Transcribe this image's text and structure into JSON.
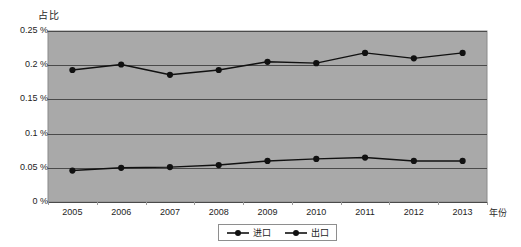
{
  "chart_data": {
    "type": "line",
    "title": "",
    "ylabel": "占比",
    "xlabel": "年份",
    "categories": [
      "2005",
      "2006",
      "2007",
      "2008",
      "2009",
      "2010",
      "2011",
      "2012",
      "2013"
    ],
    "ylim": [
      0,
      0.25
    ],
    "ytick_labels": [
      "0.25 %",
      "0.2 %",
      "0.15 %",
      "0.1 %",
      "0.05 %",
      "0  %"
    ],
    "ytick_values": [
      0.25,
      0.2,
      0.15,
      0.1,
      0.05,
      0
    ],
    "grid": true,
    "legend_position": "bottom",
    "plot_background": "#a9a9a9",
    "series": [
      {
        "name": "进口",
        "color": "#111111",
        "marker": "circle",
        "values": [
          0.193,
          0.201,
          0.186,
          0.193,
          0.205,
          0.203,
          0.218,
          0.21,
          0.218
        ]
      },
      {
        "name": "出口",
        "color": "#111111",
        "marker": "circle",
        "values": [
          0.046,
          0.05,
          0.051,
          0.054,
          0.06,
          0.063,
          0.065,
          0.06,
          0.06
        ]
      }
    ]
  },
  "legend": {
    "entries": [
      {
        "label": "进口"
      },
      {
        "label": "出口"
      }
    ]
  }
}
